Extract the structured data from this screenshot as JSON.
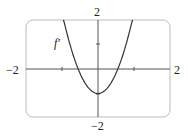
{
  "chart_data": {
    "type": "line",
    "title": "",
    "series": [
      {
        "name": "f'",
        "function": "approx 3.3x^2 - 1",
        "x": [
          -0.95,
          -0.75,
          -0.55,
          -0.3,
          0,
          0.3,
          0.55,
          0.75,
          0.95
        ],
        "y": [
          2,
          0.86,
          0,
          -0.7,
          -1,
          -0.7,
          0,
          0.86,
          2
        ]
      }
    ],
    "curve_label": "f'",
    "xlabel": "",
    "ylabel": "",
    "xlim": [
      -2,
      2
    ],
    "ylim": [
      -2,
      2
    ],
    "x_tick_labels": [
      "-2",
      "2"
    ],
    "y_tick_labels": [
      "2",
      "-2"
    ],
    "grid": false,
    "legend": "none"
  },
  "labels": {
    "y_top": "2",
    "y_bottom": "−2",
    "x_left": "−2",
    "x_right": "2",
    "curve": "f′"
  }
}
